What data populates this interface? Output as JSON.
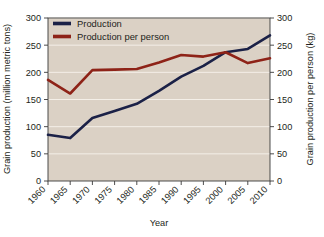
{
  "chart_data": {
    "type": "line",
    "title": "",
    "xlabel": "Year",
    "ylabel": "Grain production (million metric tons)",
    "y2label": "Grain production per person (kg)",
    "x": [
      1960,
      1965,
      1970,
      1975,
      1980,
      1985,
      1990,
      1995,
      2000,
      2005,
      2010
    ],
    "xtick_labels": [
      "1960",
      "1965",
      "1970",
      "1975",
      "1980",
      "1985",
      "1990",
      "1995",
      "2000",
      "2005",
      "2010"
    ],
    "ytick_labels": [
      "0",
      "50",
      "100",
      "150",
      "200",
      "250",
      "300"
    ],
    "ytick_values": [
      0,
      50,
      100,
      150,
      200,
      250,
      300
    ],
    "y2tick_labels": [
      "0",
      "50",
      "100",
      "150",
      "200",
      "250",
      "300"
    ],
    "y2tick_values": [
      0,
      50,
      100,
      150,
      200,
      250,
      300
    ],
    "ylim": [
      0,
      300
    ],
    "y2lim": [
      0,
      300
    ],
    "grid": "horizontal",
    "grid_color": "#f4efe8",
    "plot_background": "#dbd1c5",
    "legend_position": "top-left",
    "series": [
      {
        "name": "Production",
        "axis": "left",
        "color": "#1b2147",
        "unit": "million metric tons",
        "values": [
          85,
          79,
          116,
          129,
          142,
          166,
          192,
          212,
          237,
          243,
          268
        ]
      },
      {
        "name": "Production per person",
        "axis": "right",
        "color": "#8e2318",
        "unit": "kg",
        "values": [
          186,
          161,
          204,
          205,
          206,
          218,
          232,
          229,
          237,
          217,
          226
        ]
      }
    ]
  },
  "legend": {
    "items": [
      {
        "label": "Production",
        "color": "#1b2147"
      },
      {
        "label": "Production per person",
        "color": "#8e2318"
      }
    ]
  },
  "axes": {
    "left_title": "Grain production (million metric tons)",
    "right_title": "Grain production per person (kg)",
    "x_title": "Year"
  }
}
